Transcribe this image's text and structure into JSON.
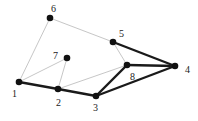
{
  "diagram": {
    "type": "graph",
    "nodes": [
      {
        "id": "1",
        "label": "1",
        "x": 19,
        "y": 82,
        "lx": 12,
        "ly": 97
      },
      {
        "id": "2",
        "label": "2",
        "x": 58,
        "y": 89,
        "lx": 56,
        "ly": 106
      },
      {
        "id": "3",
        "label": "3",
        "x": 96,
        "y": 96,
        "lx": 93,
        "ly": 111
      },
      {
        "id": "4",
        "label": "4",
        "x": 175,
        "y": 66,
        "lx": 185,
        "ly": 73
      },
      {
        "id": "5",
        "label": "5",
        "x": 113,
        "y": 42,
        "lx": 119,
        "ly": 37
      },
      {
        "id": "6",
        "label": "6",
        "x": 50,
        "y": 18,
        "lx": 51,
        "ly": 12
      },
      {
        "id": "7",
        "label": "7",
        "x": 67,
        "y": 58,
        "lx": 53,
        "ly": 59
      },
      {
        "id": "8",
        "label": "8",
        "x": 127,
        "y": 65,
        "lx": 130,
        "ly": 80
      }
    ],
    "edges": [
      {
        "from": "1",
        "to": "6",
        "style": "thin"
      },
      {
        "from": "6",
        "to": "5",
        "style": "thin"
      },
      {
        "from": "1",
        "to": "7",
        "style": "thin"
      },
      {
        "from": "7",
        "to": "2",
        "style": "thin"
      },
      {
        "from": "2",
        "to": "8",
        "style": "thin"
      },
      {
        "from": "5",
        "to": "8",
        "style": "thin"
      },
      {
        "from": "1",
        "to": "2",
        "style": "thick"
      },
      {
        "from": "2",
        "to": "3",
        "style": "thick"
      },
      {
        "from": "3",
        "to": "8",
        "style": "thick"
      },
      {
        "from": "3",
        "to": "4",
        "style": "thick"
      },
      {
        "from": "8",
        "to": "4",
        "style": "thick"
      },
      {
        "from": "5",
        "to": "4",
        "style": "thick"
      }
    ],
    "colors": {
      "thin": "#b8b8b8",
      "thick": "#1a1a1a",
      "node": "#111111"
    }
  }
}
